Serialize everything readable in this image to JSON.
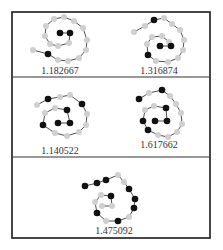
{
  "figure": {
    "frame": {
      "x": 12,
      "y": 12,
      "w": 198,
      "h": 226
    },
    "dividers": [
      {
        "y": 77,
        "x1": 12,
        "x2": 210
      },
      {
        "y": 157,
        "x1": 12,
        "x2": 210
      }
    ],
    "colors": {
      "black_node": "#111111",
      "gray_node": "#cfcfcf",
      "edge": "#3a3a3a",
      "frame": "#1a1a1a"
    },
    "panels": [
      {
        "label": "1.182667",
        "label_pos": [
          60,
          74
        ],
        "nodes": [
          [
            33,
            50,
            "G"
          ],
          [
            48,
            54,
            "B"
          ],
          [
            58,
            60,
            "G"
          ],
          [
            68,
            61,
            "G"
          ],
          [
            79,
            58,
            "G"
          ],
          [
            86,
            50,
            "G"
          ],
          [
            87,
            40,
            "G"
          ],
          [
            83,
            28,
            "G"
          ],
          [
            74,
            21,
            "G"
          ],
          [
            64,
            17,
            "G"
          ],
          [
            54,
            19,
            "G"
          ],
          [
            46,
            26,
            "G"
          ],
          [
            45,
            36,
            "G"
          ],
          [
            50,
            44,
            "G"
          ],
          [
            58,
            46,
            "G"
          ],
          [
            69,
            43,
            "G"
          ],
          [
            70,
            33,
            "B"
          ],
          [
            60,
            33,
            "B"
          ]
        ]
      },
      {
        "label": "1.316874",
        "label_pos": [
          159,
          74
        ],
        "nodes": [
          [
            134,
            32,
            "G"
          ],
          [
            145,
            26,
            "G"
          ],
          [
            154,
            20,
            "B"
          ],
          [
            164,
            18,
            "G"
          ],
          [
            172,
            24,
            "G"
          ],
          [
            180,
            30,
            "G"
          ],
          [
            184,
            40,
            "G"
          ],
          [
            183,
            50,
            "G"
          ],
          [
            178,
            58,
            "G"
          ],
          [
            168,
            62,
            "G"
          ],
          [
            156,
            61,
            "G"
          ],
          [
            148,
            55,
            "B"
          ],
          [
            147,
            44,
            "G"
          ],
          [
            152,
            37,
            "G"
          ],
          [
            162,
            36,
            "G"
          ],
          [
            169,
            42,
            "G"
          ],
          [
            171,
            46,
            "B"
          ],
          [
            160,
            46,
            "B"
          ]
        ]
      },
      {
        "label": "1.140522",
        "label_pos": [
          60,
          154
        ],
        "nodes": [
          [
            37,
            105,
            "G"
          ],
          [
            48,
            99,
            "B"
          ],
          [
            60,
            97,
            "G"
          ],
          [
            70,
            95,
            "G"
          ],
          [
            82,
            104,
            "B"
          ],
          [
            87,
            114,
            "G"
          ],
          [
            86,
            125,
            "G"
          ],
          [
            79,
            132,
            "G"
          ],
          [
            67,
            136,
            "G"
          ],
          [
            55,
            133,
            "G"
          ],
          [
            43,
            125,
            "B"
          ],
          [
            45,
            113,
            "G"
          ],
          [
            55,
            108,
            "G"
          ],
          [
            67,
            110,
            "B"
          ],
          [
            70,
            123,
            "B"
          ],
          [
            58,
            123,
            "B"
          ]
        ]
      },
      {
        "label": "1.617662",
        "label_pos": [
          159,
          148
        ],
        "nodes": [
          [
            139,
            99,
            "B"
          ],
          [
            149,
            93,
            "G"
          ],
          [
            162,
            90,
            "B"
          ],
          [
            170,
            96,
            "G"
          ],
          [
            176,
            104,
            "G"
          ],
          [
            181,
            113,
            "G"
          ],
          [
            182,
            124,
            "G"
          ],
          [
            177,
            132,
            "G"
          ],
          [
            168,
            137,
            "G"
          ],
          [
            158,
            135,
            "G"
          ],
          [
            148,
            130,
            "B"
          ],
          [
            143,
            121,
            "B"
          ],
          [
            145,
            110,
            "G"
          ],
          [
            154,
            106,
            "G"
          ],
          [
            166,
            108,
            "B"
          ],
          [
            167,
            121,
            "B"
          ],
          [
            155,
            121,
            "B"
          ]
        ]
      },
      {
        "label": "1.475092",
        "label_pos": [
          114,
          234
        ],
        "nodes": [
          [
            85,
            186,
            "B"
          ],
          [
            97,
            183,
            "B"
          ],
          [
            106,
            180,
            "B"
          ],
          [
            118,
            175,
            "G"
          ],
          [
            124,
            182,
            "G"
          ],
          [
            129,
            189,
            "B"
          ],
          [
            135,
            199,
            "B"
          ],
          [
            134,
            208,
            "B"
          ],
          [
            129,
            217,
            "G"
          ],
          [
            118,
            221,
            "B"
          ],
          [
            106,
            221,
            "G"
          ],
          [
            97,
            213,
            "B"
          ],
          [
            95,
            202,
            "G"
          ],
          [
            101,
            195,
            "G"
          ],
          [
            111,
            196,
            "B"
          ],
          [
            112,
            206,
            "G"
          ],
          [
            102,
            206,
            "G"
          ]
        ]
      }
    ]
  }
}
